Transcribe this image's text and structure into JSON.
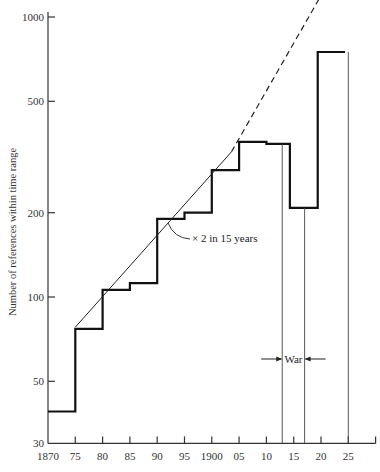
{
  "chart_data": {
    "type": "line",
    "subtype": "step",
    "title": "",
    "xlabel": "",
    "ylabel": "Number of references within time range",
    "yscale": "log",
    "ylim": [
      30,
      1000
    ],
    "xlim": [
      1870,
      1930
    ],
    "yticks": [
      {
        "value": 1000,
        "label": "1000"
      },
      {
        "value": 500,
        "label": "500"
      },
      {
        "value": 200,
        "label": "200"
      },
      {
        "value": 100,
        "label": "100"
      },
      {
        "value": 50,
        "label": "50"
      },
      {
        "value": 30,
        "label": "30"
      }
    ],
    "xticks": [
      {
        "value": 1870,
        "label": "1870"
      },
      {
        "value": 1875,
        "label": "75"
      },
      {
        "value": 1880,
        "label": "80"
      },
      {
        "value": 1885,
        "label": "85"
      },
      {
        "value": 1890,
        "label": "90"
      },
      {
        "value": 1895,
        "label": "95"
      },
      {
        "value": 1900,
        "label": "1900"
      },
      {
        "value": 1905,
        "label": "05"
      },
      {
        "value": 1910,
        "label": "10"
      },
      {
        "value": 1915,
        "label": "15"
      },
      {
        "value": 1920,
        "label": "20"
      },
      {
        "value": 1925,
        "label": "25"
      },
      {
        "value": 1930,
        "label": ""
      }
    ],
    "series": [
      {
        "name": "references",
        "steps": [
          {
            "x0": 1870,
            "x1": 1875,
            "value": 39
          },
          {
            "x0": 1875,
            "x1": 1880,
            "value": 77
          },
          {
            "x0": 1880,
            "x1": 1885,
            "value": 106
          },
          {
            "x0": 1885,
            "x1": 1890,
            "value": 112
          },
          {
            "x0": 1890,
            "x1": 1895,
            "value": 190
          },
          {
            "x0": 1895,
            "x1": 1900,
            "value": 200
          },
          {
            "x0": 1900,
            "x1": 1905,
            "value": 284
          },
          {
            "x0": 1905,
            "x1": 1910,
            "value": 358
          },
          {
            "x0": 1910,
            "x1": 1914.3,
            "value": 352
          },
          {
            "x0": 1914.3,
            "x1": 1919.4,
            "value": 208
          },
          {
            "x0": 1919.4,
            "x1": 1924.4,
            "value": 750
          }
        ]
      }
    ],
    "trend_line": {
      "label": "× 2 in 15 years",
      "solid": {
        "x0": 1875,
        "y0": 78,
        "x1": 1903.6,
        "y1": 330
      },
      "dashed": {
        "x0": 1903.6,
        "y0": 330,
        "x1": 1925.6,
        "y1": 1850
      }
    },
    "reference_lines": [
      {
        "x": 1912.9,
        "from_value": 352
      },
      {
        "x": 1917.0,
        "from_value": 208
      },
      {
        "x": 1925.0,
        "from_value": 750
      }
    ],
    "annotations": [
      {
        "text": "War",
        "x0": 1912.9,
        "x1": 1917.0,
        "type": "bracket-arrows"
      }
    ]
  }
}
